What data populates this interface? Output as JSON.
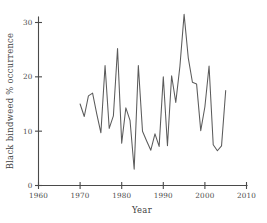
{
  "chart_data": {
    "type": "line",
    "title": "",
    "subtitle": "",
    "xlabel": "Year",
    "ylabel": "Black bindweed  % occurrence",
    "xlim": [
      1960,
      2010
    ],
    "ylim": [
      0,
      32
    ],
    "xticks": [
      1960,
      1970,
      1980,
      1990,
      2000,
      2010
    ],
    "xtick_labels": [
      "1960",
      "1970",
      "1980",
      "1990",
      "2000",
      "2010"
    ],
    "yticks": [
      0,
      10,
      20,
      30
    ],
    "ytick_labels": [
      "0",
      "10",
      "20",
      "30"
    ],
    "grid": false,
    "legend": false,
    "legend_position": "none",
    "line_color": "#5b5b5b",
    "axis_color": "#4a4a4a",
    "background_color": "#ffffff",
    "series": [
      {
        "name": "Black bindweed % occurrence",
        "x": [
          1970,
          1971,
          1972,
          1973,
          1974,
          1975,
          1976,
          1977,
          1978,
          1979,
          1980,
          1981,
          1982,
          1983,
          1984,
          1985,
          1986,
          1987,
          1988,
          1989,
          1990,
          1991,
          1992,
          1993,
          1994,
          1995,
          1996,
          1997,
          1998,
          1999,
          2000,
          2001,
          2002,
          2003,
          2004,
          2005
        ],
        "values": [
          15.0,
          12.7,
          16.5,
          17.0,
          13.2,
          9.7,
          22.1,
          10.5,
          12.8,
          25.2,
          7.8,
          14.3,
          12.0,
          3.0,
          22.1,
          10.0,
          8.2,
          6.5,
          9.5,
          7.2,
          20.0,
          7.3,
          20.2,
          15.3,
          22.0,
          31.5,
          23.5,
          19.0,
          18.7,
          10.1,
          14.5,
          22.0,
          7.5,
          6.4,
          7.3,
          17.5
        ]
      }
    ]
  },
  "axes": {
    "x_label": "Year",
    "y_label": "Black bindweed  % occurrence"
  }
}
